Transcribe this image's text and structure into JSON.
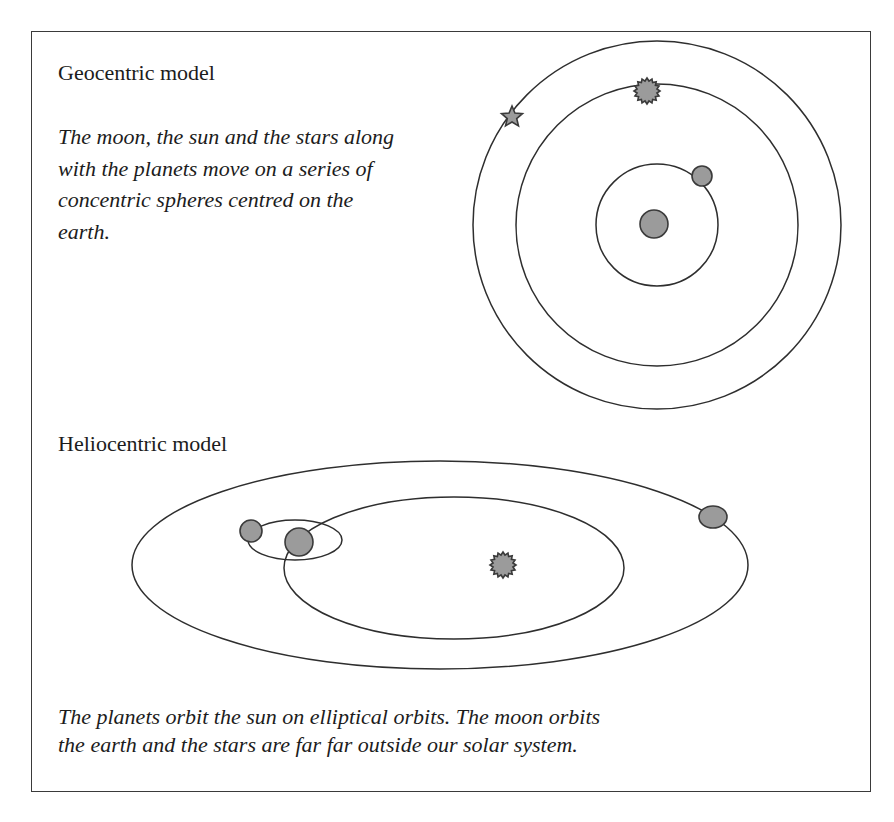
{
  "geocentric": {
    "title": "Geocentric model",
    "caption_lines": [
      "The moon, the sun and the stars along",
      "with the planets move on a series of",
      "concentric spheres centred on the",
      "earth."
    ],
    "diagram": {
      "center": [
        657,
        225
      ],
      "orbits": [
        {
          "name": "inner-sphere",
          "r": 61
        },
        {
          "name": "middle-sphere",
          "r": 141
        },
        {
          "name": "outer-sphere",
          "r": 184
        }
      ],
      "bodies": [
        {
          "name": "earth",
          "shape": "circle",
          "cx": 654,
          "cy": 224,
          "r": 14
        },
        {
          "name": "moon",
          "shape": "circle",
          "cx": 702,
          "cy": 176,
          "r": 10
        },
        {
          "name": "sun",
          "shape": "starburst",
          "cx": 647,
          "cy": 91,
          "r": 13
        },
        {
          "name": "star",
          "shape": "star",
          "cx": 512,
          "cy": 117,
          "r": 11
        }
      ]
    }
  },
  "heliocentric": {
    "title": "Heliocentric model",
    "caption_lines": [
      "The planets orbit the sun on elliptical orbits. The moon orbits",
      "the earth and the stars are far far outside our solar system."
    ],
    "diagram": {
      "orbits": [
        {
          "name": "outer-planet-orbit",
          "cx": 440,
          "cy": 565,
          "rx": 308,
          "ry": 104
        },
        {
          "name": "earth-orbit",
          "cx": 454,
          "cy": 568,
          "rx": 170,
          "ry": 71
        },
        {
          "name": "moon-orbit",
          "cx": 295,
          "cy": 540,
          "rx": 47,
          "ry": 20
        }
      ],
      "bodies": [
        {
          "name": "sun",
          "shape": "starburst",
          "cx": 503,
          "cy": 565,
          "r": 13
        },
        {
          "name": "earth",
          "shape": "circle",
          "cx": 299,
          "cy": 542,
          "r": 14
        },
        {
          "name": "moon",
          "shape": "circle",
          "cx": 251,
          "cy": 531,
          "r": 11
        },
        {
          "name": "outer-planet",
          "shape": "ellipse",
          "cx": 713,
          "cy": 517,
          "rx": 14,
          "ry": 11
        }
      ]
    }
  },
  "colors": {
    "line": "#2e2e2e",
    "body_fill": "#9b9b9b",
    "body_stroke": "#3a3a3a",
    "frame": "#3a3a3a",
    "text": "#1c1c1c"
  }
}
